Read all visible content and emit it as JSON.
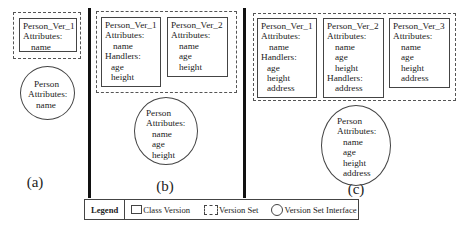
{
  "panels": {
    "a": {
      "caption": "(a)",
      "versions": [
        {
          "title": "Person_Ver_1",
          "attributes_label": "Attributes:",
          "attributes": [
            "name"
          ]
        }
      ],
      "interface": {
        "title": "Person",
        "attributes_label": "Attributes:",
        "attributes": [
          "name"
        ]
      }
    },
    "b": {
      "caption": "(b)",
      "versions": [
        {
          "title": "Person_Ver_1",
          "attributes_label": "Attributes:",
          "attributes": [
            "name"
          ],
          "handlers_label": "Handlers:",
          "handlers": [
            "age",
            "height"
          ]
        },
        {
          "title": "Person_Ver_2",
          "attributes_label": "Attributes:",
          "attributes": [
            "name",
            "age",
            "height"
          ]
        }
      ],
      "interface": {
        "title": "Person",
        "attributes_label": "Attributes:",
        "attributes": [
          "name",
          "age",
          "height"
        ]
      }
    },
    "c": {
      "caption": "(c)",
      "versions": [
        {
          "title": "Person_Ver_1",
          "attributes_label": "Attributes:",
          "attributes": [
            "name"
          ],
          "handlers_label": "Handlers:",
          "handlers": [
            "age",
            "height",
            "address"
          ]
        },
        {
          "title": "Person_Ver_2",
          "attributes_label": "Attributes:",
          "attributes": [
            "name",
            "age",
            "height"
          ],
          "handlers_label": "Handlers:",
          "handlers": [
            "address"
          ]
        },
        {
          "title": "Person_Ver_3",
          "attributes_label": "Attributes:",
          "attributes": [
            "name",
            "age",
            "height",
            "address"
          ]
        }
      ],
      "interface": {
        "title": "Person",
        "attributes_label": "Attributes:",
        "attributes": [
          "name",
          "age",
          "height",
          "address"
        ]
      }
    }
  },
  "legend": {
    "title": "Legend",
    "items": [
      {
        "symbol": "solid-rectangle",
        "label": "Class Version"
      },
      {
        "symbol": "dashed-rectangle",
        "label": "Version Set"
      },
      {
        "symbol": "circle",
        "label": "Version Set Interface"
      }
    ]
  }
}
